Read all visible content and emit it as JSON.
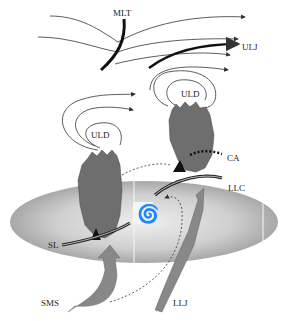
{
  "labels": {
    "mlt": "MLT",
    "ulj": "ULJ",
    "uld_right": "ULD",
    "uld_left": "ULD",
    "ca": "CA",
    "llc": "LLC",
    "sl": "SL",
    "sms": "SMS",
    "llj": "LLJ"
  },
  "colors": {
    "ellipse_center": "#e6e6e6",
    "ellipse_edge": "#a8a8a8",
    "cloud": "#6e6e6e",
    "arrow_fill": "#8a8a8a",
    "line": "#333333"
  }
}
